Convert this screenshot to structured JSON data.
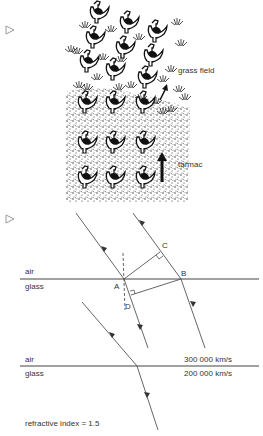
{
  "figure1": {
    "marker": "triangle-bullet-icon",
    "grass_label": "grass field",
    "tarmac_label": "tarmac",
    "rows": 5,
    "cols": 3
  },
  "figure2": {
    "marker": "triangle-bullet-icon",
    "upper_medium": "air",
    "lower_medium": "glass",
    "points": {
      "A": "A",
      "B": "B",
      "C": "C",
      "D": "D"
    }
  },
  "figure3": {
    "upper_medium": "air",
    "lower_medium": "glass",
    "air_speed": "300 000 km/s",
    "glass_speed": "200 000 km/s",
    "refractive_index": "refractive index = 1.5"
  },
  "colors": {
    "ink": "#222222",
    "line": "#555555",
    "paper": "#ffffff"
  }
}
